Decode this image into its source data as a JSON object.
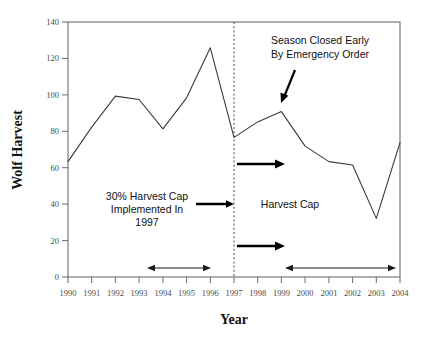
{
  "chart_data": {
    "type": "line",
    "title": "",
    "xlabel": "Year",
    "ylabel": "Wolf Harvest",
    "x": [
      1990,
      1991,
      1992,
      1993,
      1994,
      1995,
      1996,
      1997,
      1998,
      1999,
      2000,
      2001,
      2002,
      2003,
      2004
    ],
    "values": [
      67,
      87,
      105,
      103,
      86,
      104,
      133,
      81,
      90,
      96,
      76,
      67,
      65,
      34,
      78
    ],
    "categories": [
      "1990",
      "1991",
      "1992",
      "1993",
      "1994",
      "1995",
      "1996",
      "1997",
      "1998",
      "1999",
      "2000",
      "2001",
      "2002",
      "2003",
      "2004"
    ],
    "xtick_labels": [
      "1990",
      "1991",
      "1992",
      "1993",
      "1994",
      "1995",
      "1996",
      "1997",
      "1998",
      "1999",
      "2000",
      "2001",
      "2002",
      "2003",
      "2004"
    ],
    "ytick_labels": [
      "0",
      "20",
      "40",
      "60",
      "80",
      "100",
      "120",
      "140"
    ],
    "ytick_values": [
      0,
      20,
      40,
      60,
      80,
      100,
      120,
      140
    ],
    "ylim": [
      0,
      148
    ],
    "xlim": [
      1989.5,
      2004.6
    ],
    "grid": false,
    "legend": false,
    "series": [
      {
        "name": "Wolf Harvest",
        "values": [
          67,
          87,
          105,
          103,
          86,
          104,
          133,
          81,
          90,
          96,
          76,
          67,
          65,
          34,
          78
        ]
      }
    ],
    "annotations": [
      {
        "name": "harvest-cap-note",
        "lines": [
          "30% Harvest Cap",
          "Implemented In",
          "1997"
        ],
        "text": "30% Harvest Cap Implemented In 1997"
      },
      {
        "name": "season-closed-note",
        "lines": [
          "Season Closed Early",
          "By Emergency Order"
        ],
        "text": "Season Closed Early By Emergency Order"
      },
      {
        "name": "harvest-cap-region-label",
        "lines": [
          "Harvest Cap"
        ],
        "text": "Harvest Cap"
      }
    ],
    "reference_line": {
      "name": "year-1997-divider",
      "x": 1997,
      "style": "dashed",
      "label": "1997"
    },
    "period_brackets": [
      {
        "name": "pre-cap-period",
        "from": 1993,
        "to": 1996
      },
      {
        "name": "post-cap-period",
        "from": 1999,
        "to": 2004
      }
    ]
  },
  "axis": {
    "x_title": "Year",
    "y_title": "Wolf Harvest"
  },
  "labels": {
    "anno_cap_l1": "30% Harvest Cap",
    "anno_cap_l2": "Implemented In",
    "anno_cap_l3": "1997",
    "anno_season_l1": "Season Closed Early",
    "anno_season_l2": "By Emergency Order",
    "anno_harvest_cap": "Harvest Cap",
    "y0": "0",
    "y20": "20",
    "y40": "40",
    "y60": "60",
    "y80": "80",
    "y100": "100",
    "y120": "120",
    "y140": "140",
    "x1990": "1990",
    "x1991": "1991",
    "x1992": "1992",
    "x1993": "1993",
    "x1994": "1994",
    "x1995": "1995",
    "x1996": "1996",
    "x1997": "1997",
    "x1998": "1998",
    "x1999": "1999",
    "x2000": "2000",
    "x2001": "2001",
    "x2002": "2002",
    "x2003": "2003",
    "x2004": "2004"
  },
  "colors": {
    "line": "#3a3a3a",
    "frame": "#7a7a7a",
    "text": "#111111",
    "tick_text": "#4a4a4a",
    "background": "#ffffff"
  }
}
